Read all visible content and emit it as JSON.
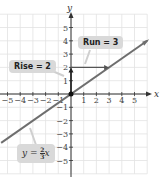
{
  "chart_data": {
    "type": "line",
    "title": "",
    "xlabel": "x",
    "ylabel": "y",
    "xlim": [
      -5.5,
      6
    ],
    "ylim": [
      -6,
      6
    ],
    "grid": true,
    "x_ticks": [
      -5,
      -4,
      -3,
      -2,
      -1,
      1,
      2,
      3,
      4,
      5
    ],
    "y_ticks": [
      -5,
      -4,
      -3,
      -2,
      -1,
      1,
      2,
      3,
      4,
      5
    ],
    "series": [
      {
        "name": "y = (2/3)x",
        "slope": 0.6667,
        "intercept": 0,
        "x": [
          -5.5,
          6
        ],
        "y": [
          -3.67,
          4
        ],
        "color": "#6e6e6e"
      }
    ],
    "annotations": [
      {
        "text": "Rise = 2",
        "type": "vertical-arrow",
        "from": [
          0,
          0
        ],
        "to": [
          0,
          2
        ]
      },
      {
        "text": "Run = 3",
        "type": "horizontal-arrow",
        "from": [
          0,
          2
        ],
        "to": [
          3,
          2
        ]
      },
      {
        "text": "y = ⅔x",
        "type": "equation-label"
      }
    ],
    "points": [
      {
        "x": 0,
        "y": 0
      }
    ]
  },
  "labels": {
    "rise": "Rise = 2",
    "run": "Run = 3",
    "equation_prefix": "y = ",
    "equation_num": "2",
    "equation_den": "3",
    "equation_suffix": "x",
    "x_axis": "x",
    "y_axis": "y"
  },
  "colors": {
    "grid": "#e2e2e2",
    "axis": "#333333",
    "line": "#707070",
    "label_bg": "#d9d9d9"
  }
}
